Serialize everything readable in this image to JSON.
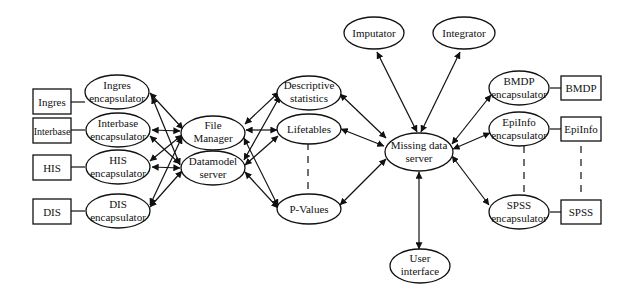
{
  "diagram": {
    "nodes": [
      {
        "id": "ingres",
        "shape": "rect",
        "lines": [
          "Ingres"
        ],
        "x": 28,
        "y": 129,
        "w": 43,
        "h": 25
      },
      {
        "id": "interbase",
        "shape": "rect",
        "lines": [
          "Interbase"
        ],
        "x": 30,
        "y": 129,
        "w": 45,
        "h": 25
      },
      {
        "id": "his",
        "shape": "rect",
        "lines": [
          "HIS"
        ],
        "x": 30,
        "y": 129,
        "w": 43,
        "h": 25
      },
      {
        "id": "dis",
        "shape": "rect",
        "lines": [
          "DIS"
        ],
        "x": 30,
        "y": 129,
        "w": 43,
        "h": 25
      },
      {
        "id": "ingres_enc",
        "shape": "ellipse",
        "lines": [
          "Ingres",
          "encapsulator"
        ]
      },
      {
        "id": "interbase_enc",
        "shape": "ellipse",
        "lines": [
          "Interbase",
          "encapsulator"
        ]
      },
      {
        "id": "his_enc",
        "shape": "ellipse",
        "lines": [
          "HIS",
          "encapsulator"
        ]
      },
      {
        "id": "dis_enc",
        "shape": "ellipse",
        "lines": [
          "DIS",
          "encapsulator"
        ]
      },
      {
        "id": "file_manager",
        "shape": "ellipse",
        "lines": [
          "File",
          "Manager"
        ]
      },
      {
        "id": "datamodel_server",
        "shape": "ellipse",
        "lines": [
          "Datamodel",
          "server"
        ]
      },
      {
        "id": "descriptive_stats",
        "shape": "ellipse",
        "lines": [
          "Descriptive",
          "statistics"
        ]
      },
      {
        "id": "lifetables",
        "shape": "ellipse",
        "lines": [
          "Lifetables"
        ]
      },
      {
        "id": "p_values",
        "shape": "ellipse",
        "lines": [
          "P-Values"
        ]
      },
      {
        "id": "imputator",
        "shape": "ellipse",
        "lines": [
          "Imputator"
        ]
      },
      {
        "id": "integrator",
        "shape": "ellipse",
        "lines": [
          "Integrator"
        ]
      },
      {
        "id": "missing_data_server",
        "shape": "ellipse",
        "lines": [
          "Missing data",
          "server"
        ]
      },
      {
        "id": "user_interface",
        "shape": "ellipse",
        "lines": [
          "User",
          "interface"
        ]
      },
      {
        "id": "bmdp_enc",
        "shape": "ellipse",
        "lines": [
          "BMDP",
          "encapsulator"
        ]
      },
      {
        "id": "epiinfo_enc",
        "shape": "ellipse",
        "lines": [
          "EpiInfo",
          "encapsulator"
        ]
      },
      {
        "id": "spss_enc",
        "shape": "ellipse",
        "lines": [
          "SPSS",
          "encapsulator"
        ]
      },
      {
        "id": "bmdp",
        "shape": "rect",
        "lines": [
          "BMDP"
        ]
      },
      {
        "id": "epiinfo",
        "shape": "rect",
        "lines": [
          "EpiInfo"
        ]
      },
      {
        "id": "spss",
        "shape": "rect",
        "lines": [
          "SPSS"
        ]
      }
    ],
    "labels": {
      "ingres": "Ingres",
      "interbase": "Interbase",
      "his": "HIS",
      "dis": "DIS",
      "ingres_enc_1": "Ingres",
      "interbase_enc_1": "Interbase",
      "his_enc_1": "HIS",
      "dis_enc_1": "DIS",
      "encapsulator": "encapsulator",
      "file_manager_1": "File",
      "file_manager_2": "Manager",
      "datamodel_1": "Datamodel",
      "datamodel_2": "server",
      "descriptive_1": "Descriptive",
      "descriptive_2": "statistics",
      "lifetables": "Lifetables",
      "p_values": "P-Values",
      "imputator": "Imputator",
      "integrator": "Integrator",
      "missing_1": "Missing data",
      "missing_2": "server",
      "user_1": "User",
      "user_2": "interface",
      "bmdp_enc_1": "BMDP",
      "epiinfo_enc_1": "EpiInfo",
      "spss_enc_1": "SPSS",
      "bmdp": "BMDP",
      "epiinfo": "EpiInfo",
      "spss": "SPSS"
    },
    "edges": [
      {
        "from": "ingres",
        "to": "ingres_enc",
        "type": "line"
      },
      {
        "from": "interbase",
        "to": "interbase_enc",
        "type": "line"
      },
      {
        "from": "his",
        "to": "his_enc",
        "type": "line"
      },
      {
        "from": "dis",
        "to": "dis_enc",
        "type": "line"
      },
      {
        "from": "ingres_enc",
        "to": "file_manager",
        "type": "bidirectional"
      },
      {
        "from": "ingres_enc",
        "to": "datamodel_server",
        "type": "bidirectional"
      },
      {
        "from": "interbase_enc",
        "to": "file_manager",
        "type": "bidirectional"
      },
      {
        "from": "interbase_enc",
        "to": "datamodel_server",
        "type": "bidirectional"
      },
      {
        "from": "his_enc",
        "to": "file_manager",
        "type": "bidirectional"
      },
      {
        "from": "his_enc",
        "to": "datamodel_server",
        "type": "bidirectional"
      },
      {
        "from": "dis_enc",
        "to": "file_manager",
        "type": "bidirectional"
      },
      {
        "from": "dis_enc",
        "to": "datamodel_server",
        "type": "bidirectional"
      },
      {
        "from": "file_manager",
        "to": "descriptive_stats",
        "type": "bidirectional"
      },
      {
        "from": "file_manager",
        "to": "lifetables",
        "type": "bidirectional"
      },
      {
        "from": "file_manager",
        "to": "p_values",
        "type": "bidirectional"
      },
      {
        "from": "datamodel_server",
        "to": "descriptive_stats",
        "type": "bidirectional"
      },
      {
        "from": "datamodel_server",
        "to": "lifetables",
        "type": "bidirectional"
      },
      {
        "from": "datamodel_server",
        "to": "p_values",
        "type": "bidirectional"
      },
      {
        "from": "descriptive_stats",
        "to": "missing_data_server",
        "type": "bidirectional"
      },
      {
        "from": "lifetables",
        "to": "missing_data_server",
        "type": "bidirectional"
      },
      {
        "from": "p_values",
        "to": "missing_data_server",
        "type": "bidirectional"
      },
      {
        "from": "lifetables",
        "to": "p_values",
        "type": "dashed"
      },
      {
        "from": "imputator",
        "to": "missing_data_server",
        "type": "bidirectional"
      },
      {
        "from": "integrator",
        "to": "missing_data_server",
        "type": "bidirectional"
      },
      {
        "from": "user_interface",
        "to": "missing_data_server",
        "type": "bidirectional"
      },
      {
        "from": "missing_data_server",
        "to": "bmdp_enc",
        "type": "bidirectional"
      },
      {
        "from": "missing_data_server",
        "to": "epiinfo_enc",
        "type": "bidirectional"
      },
      {
        "from": "missing_data_server",
        "to": "spss_enc",
        "type": "bidirectional"
      },
      {
        "from": "bmdp_enc",
        "to": "bmdp",
        "type": "line"
      },
      {
        "from": "epiinfo_enc",
        "to": "epiinfo",
        "type": "line"
      },
      {
        "from": "spss_enc",
        "to": "spss",
        "type": "line"
      },
      {
        "from": "epiinfo_enc",
        "to": "spss_enc",
        "type": "dashed"
      },
      {
        "from": "epiinfo",
        "to": "spss",
        "type": "dashed"
      }
    ]
  }
}
